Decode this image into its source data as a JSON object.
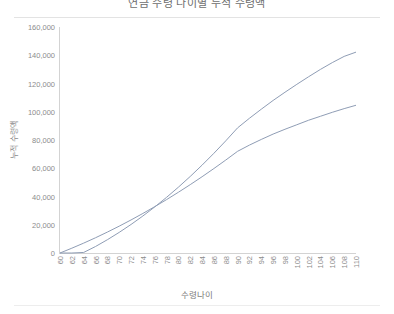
{
  "chart_data": {
    "type": "line",
    "title": "연금 수령 나이별 누적 수령액",
    "xlabel": "수령나이",
    "ylabel": "누적 수령액",
    "xlim": [
      60,
      110
    ],
    "ylim": [
      0,
      160000
    ],
    "ytick_step": 20000,
    "xtick_step": 2,
    "grid": false,
    "legend": "none",
    "categories": [
      60,
      62,
      64,
      66,
      68,
      70,
      72,
      74,
      76,
      78,
      80,
      82,
      84,
      86,
      88,
      90,
      92,
      94,
      96,
      98,
      100,
      102,
      104,
      106,
      108,
      110
    ],
    "ytick_labels": [
      "0",
      "20,000",
      "40,000",
      "60,000",
      "80,000",
      "100,000",
      "120,000",
      "140,000",
      "160,000"
    ],
    "ytick_values": [
      0,
      20000,
      40000,
      60000,
      80000,
      100000,
      120000,
      140000,
      160000
    ],
    "xtick_labels": [
      "60",
      "62",
      "64",
      "66",
      "68",
      "70",
      "72",
      "74",
      "76",
      "78",
      "80",
      "82",
      "84",
      "86",
      "88",
      "90",
      "92",
      "94",
      "96",
      "98",
      "100",
      "102",
      "104",
      "106",
      "108",
      "110"
    ],
    "series": [
      {
        "name": "조기수령",
        "color": "#8f9db5",
        "x": [
          60,
          62,
          64,
          66,
          68,
          70,
          72,
          74,
          76,
          78,
          80,
          82,
          84,
          86,
          88,
          90,
          92,
          94,
          96,
          98,
          100,
          102,
          104,
          106,
          108,
          110
        ],
        "values": [
          0,
          3400,
          7000,
          10800,
          14800,
          19000,
          23400,
          28000,
          32800,
          37800,
          43000,
          48400,
          54000,
          59800,
          65800,
          72000,
          76400,
          80400,
          84200,
          87600,
          90800,
          94000,
          96800,
          99600,
          102200,
          104600
        ]
      },
      {
        "name": "연기수령",
        "color": "#8f9db5",
        "x": [
          60,
          62,
          64,
          66,
          68,
          70,
          72,
          74,
          76,
          78,
          80,
          82,
          84,
          86,
          88,
          90,
          92,
          94,
          96,
          98,
          100,
          102,
          104,
          106,
          108,
          110
        ],
        "values": [
          0,
          0,
          400,
          4600,
          9400,
          14600,
          20200,
          26200,
          32600,
          39400,
          46600,
          54200,
          62200,
          70600,
          79400,
          88600,
          95400,
          101800,
          108000,
          113800,
          119400,
          124800,
          130000,
          134800,
          139200,
          142200
        ]
      }
    ]
  }
}
